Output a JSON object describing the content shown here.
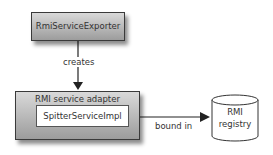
{
  "nodes": {
    "exporter": {
      "label": "RmiServiceExporter"
    },
    "adapter": {
      "label": "RMI service adapter",
      "inner_label": "SpitterServiceImpl"
    },
    "registry": {
      "label_line1": "RMI",
      "label_line2": "registry"
    }
  },
  "edges": [
    {
      "from": "exporter",
      "to": "adapter",
      "label": "creates"
    },
    {
      "from": "adapter",
      "to": "registry",
      "label": "bound in"
    }
  ]
}
